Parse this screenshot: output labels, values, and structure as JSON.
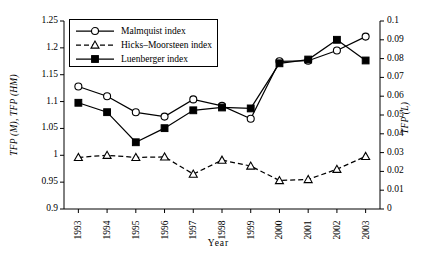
{
  "chart_data": {
    "type": "line",
    "title": "",
    "xlabel": "Year",
    "ylabel": "TFP (M), TFP (HM)",
    "ylabel_right": "TFP (L)",
    "categories": [
      "1993",
      "1994",
      "1995",
      "1996",
      "1997",
      "1998",
      "1999",
      "2000",
      "2001",
      "2002",
      "2003"
    ],
    "ylim": [
      0.9,
      1.25
    ],
    "yticks": [
      "0.9",
      "0.95",
      "1",
      "1.05",
      "1.1",
      "1.15",
      "1.2",
      "1.25"
    ],
    "ylim_right": [
      0,
      0.1
    ],
    "yticks_right": [
      "0",
      "0.01",
      "0.02",
      "0.03",
      "0.04",
      "0.05",
      "0.06",
      "0.07",
      "0.08",
      "0.09",
      "0.1"
    ],
    "grid": false,
    "legend_position": "upper-left-inside",
    "series": [
      {
        "name": "Malmquist index",
        "axis": "left",
        "marker": "open-circle",
        "linestyle": "solid",
        "values": [
          1.128,
          1.11,
          1.08,
          1.072,
          1.104,
          1.092,
          1.068,
          1.175,
          1.176,
          1.195,
          1.221
        ]
      },
      {
        "name": "Hicks–Moorsteen index",
        "axis": "left",
        "marker": "open-triangle",
        "linestyle": "dashed",
        "values": [
          0.996,
          1.0,
          0.996,
          0.997,
          0.965,
          0.991,
          0.98,
          0.953,
          0.955,
          0.974,
          0.998
        ]
      },
      {
        "name": "Luenberger index",
        "axis": "right",
        "marker": "filled-square",
        "linestyle": "solid",
        "values": [
          0.0565,
          0.0515,
          0.0355,
          0.043,
          0.0525,
          0.054,
          0.0535,
          0.0775,
          0.0795,
          0.09,
          0.079
        ]
      }
    ]
  }
}
